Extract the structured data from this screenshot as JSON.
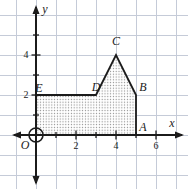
{
  "chart_data": {
    "type": "coordinate-grid-polygon",
    "canvas": {
      "width": 188,
      "height": 189
    },
    "unit_px": 20,
    "origin_px": {
      "x": 36,
      "y": 135
    },
    "colors": {
      "axis": "#1b1b1b",
      "grid": "#c5cbd8",
      "dot_fill": "#8a8a8a",
      "background": "#ffffff",
      "text": "#1b1b1b"
    },
    "grid_range": {
      "x_min": -1,
      "x_max": 7,
      "y_min": -2,
      "y_max": 6
    },
    "axes": {
      "x_label": "x",
      "y_label": "y",
      "x_axis_span_px": {
        "from": 12,
        "to": 184,
        "y": 135
      },
      "y_axis_span_px": {
        "from": 5,
        "to": 185,
        "x": 36
      },
      "x_ticks": [
        1,
        2,
        3,
        4,
        5,
        6
      ],
      "y_ticks": [
        1,
        2,
        3,
        4,
        5
      ],
      "x_tick_labels": [
        {
          "value": 2,
          "text": "2"
        },
        {
          "value": 4,
          "text": "4"
        },
        {
          "value": 6,
          "text": "6"
        }
      ],
      "y_tick_labels": [
        {
          "value": 2,
          "text": "2"
        },
        {
          "value": 4,
          "text": "4"
        }
      ],
      "x_tick_label_baseline_y": 149,
      "y_tick_label_center_x": 26,
      "axis_label_px": {
        "x": {
          "x": 172,
          "y": 127
        },
        "y": {
          "x": 45,
          "y": 13
        }
      }
    },
    "origin": {
      "label": "O",
      "circle_r": 7
    },
    "polygon": {
      "name": "OEDCBA",
      "vertices": [
        {
          "x": 0,
          "y": 0
        },
        {
          "x": 0,
          "y": 2
        },
        {
          "x": 3,
          "y": 2
        },
        {
          "x": 4,
          "y": 4
        },
        {
          "x": 5,
          "y": 2
        },
        {
          "x": 5,
          "y": 0
        }
      ]
    },
    "point_labels": {
      "O": {
        "text": "O",
        "px": {
          "x": 25,
          "y": 149
        }
      },
      "E": {
        "text": "E",
        "px": {
          "x": 39,
          "y": 92
        }
      },
      "D": {
        "text": "D",
        "px": {
          "x": 96,
          "y": 91
        }
      },
      "C": {
        "text": "C",
        "px": {
          "x": 116,
          "y": 45
        }
      },
      "B": {
        "text": "B",
        "px": {
          "x": 143,
          "y": 91
        }
      },
      "A": {
        "text": "A",
        "px": {
          "x": 143,
          "y": 131
        }
      }
    }
  }
}
